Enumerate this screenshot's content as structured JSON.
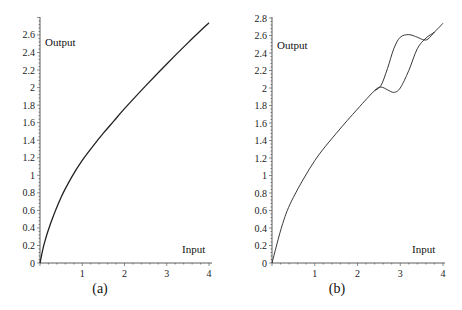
{
  "chart_data": [
    {
      "type": "line",
      "panel": "(a)",
      "caption": "(a)",
      "xlabel": "Input",
      "ylabel": "Output",
      "xlim": [
        0,
        4
      ],
      "ylim": [
        0,
        2.7
      ],
      "xticks": [
        "1",
        "2",
        "3",
        "4"
      ],
      "yticks": [
        "0",
        "0.2",
        "0.4",
        "0.6",
        "0.8",
        "1",
        "1.2",
        "1.4",
        "1.6",
        "1.8",
        "2",
        "2.2",
        "2.4",
        "2.6"
      ],
      "grid": false,
      "series": [
        {
          "name": "output",
          "x": [
            0,
            0.1,
            0.25,
            0.5,
            0.75,
            1.0,
            1.25,
            1.5,
            1.75,
            2.0,
            2.5,
            3.0,
            3.5,
            4.0
          ],
          "y": [
            0,
            0.22,
            0.45,
            0.75,
            0.98,
            1.17,
            1.33,
            1.48,
            1.62,
            1.76,
            2.02,
            2.27,
            2.51,
            2.74
          ]
        }
      ]
    },
    {
      "type": "line",
      "panel": "(b)",
      "caption": "(b)",
      "xlabel": "Input",
      "ylabel": "Output",
      "xlim": [
        0,
        4
      ],
      "ylim": [
        0,
        2.8
      ],
      "xticks": [
        "1",
        "2",
        "3",
        "4"
      ],
      "yticks": [
        "0",
        "0.2",
        "0.4",
        "0.6",
        "0.8",
        "1",
        "1.2",
        "1.4",
        "1.6",
        "1.8",
        "2",
        "2.2",
        "2.4",
        "2.6",
        "2.8"
      ],
      "grid": false,
      "series": [
        {
          "name": "lower branch",
          "x": [
            0,
            0.25,
            0.5,
            1.0,
            1.5,
            2.0,
            2.4,
            2.55,
            2.7,
            2.85,
            3.0,
            3.2,
            3.4,
            3.6,
            3.8,
            4.0
          ],
          "y": [
            0,
            0.45,
            0.75,
            1.17,
            1.48,
            1.76,
            1.97,
            2.01,
            1.98,
            1.95,
            2.0,
            2.2,
            2.45,
            2.57,
            2.64,
            2.74
          ]
        },
        {
          "name": "upper branch",
          "x": [
            2.4,
            2.55,
            2.7,
            2.85,
            3.0,
            3.2,
            3.4,
            3.55,
            3.65,
            3.8
          ],
          "y": [
            1.97,
            2.03,
            2.22,
            2.45,
            2.58,
            2.61,
            2.58,
            2.55,
            2.56,
            2.64
          ]
        }
      ]
    }
  ]
}
